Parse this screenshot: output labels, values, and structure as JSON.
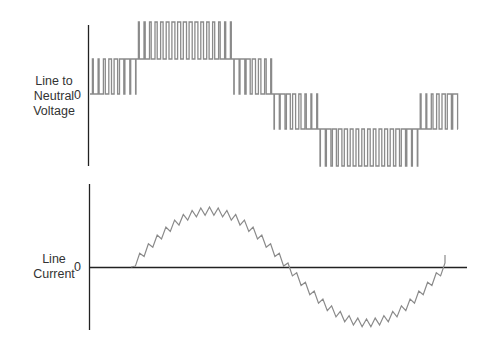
{
  "voltage_panel": {
    "label_lines": [
      "Line to",
      "Neutral",
      "Voltage"
    ],
    "zero_label": "0",
    "waveform_color": "#8a8a8a",
    "axis_color": "#222222",
    "description": "Multilevel PWM line-to-neutral voltage waveform (5 levels)"
  },
  "current_panel": {
    "label_lines": [
      "Line",
      "Current"
    ],
    "zero_label": "0",
    "waveform_color": "#8a8a8a",
    "axis_color": "#222222",
    "description": "Sinusoidal line current with ripple"
  }
}
